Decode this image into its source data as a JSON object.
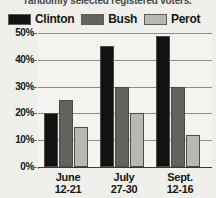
{
  "caption": "randomly selected registered voters.",
  "legend": {
    "items": [
      {
        "label": "Clinton",
        "color": "#121210"
      },
      {
        "label": "Bush",
        "color": "#63635e"
      },
      {
        "label": "Perot",
        "color": "#b9b9b2"
      }
    ]
  },
  "chart_data": {
    "type": "bar",
    "title": "",
    "xlabel": "",
    "ylabel": "",
    "ylim": [
      0,
      50
    ],
    "grid": true,
    "legend_position": "top",
    "categories": [
      "June 12-21",
      "July 27-30",
      "Sept. 12-16"
    ],
    "category_lines": [
      {
        "line1": "June",
        "line2": "12-21"
      },
      {
        "line1": "July",
        "line2": "27-30"
      },
      {
        "line1": "Sept.",
        "line2": "12-16"
      }
    ],
    "ytick_labels": [
      "50%",
      "40%",
      "30%",
      "20%",
      "10%",
      "0%"
    ],
    "ytick_values": [
      50,
      40,
      30,
      20,
      10,
      0
    ],
    "series": [
      {
        "name": "Clinton",
        "color": "#121210",
        "values": [
          20,
          45,
          49
        ]
      },
      {
        "name": "Bush",
        "color": "#63635e",
        "values": [
          25,
          30,
          30
        ]
      },
      {
        "name": "Perot",
        "color": "#b9b9b2",
        "values": [
          15,
          20,
          12
        ]
      }
    ]
  }
}
